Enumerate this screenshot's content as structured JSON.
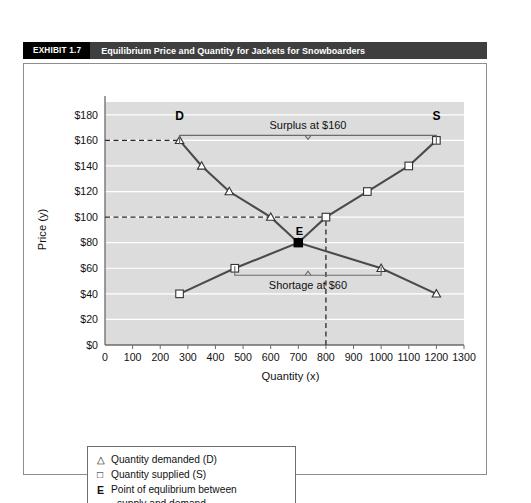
{
  "exhibit": {
    "tag": "EXHIBIT 1.7",
    "title": "Equilibrium Price and Quantity for Jackets for Snowboarders"
  },
  "legend": {
    "demand_mark": "△",
    "demand_label": "Quantity demanded (D)",
    "supply_mark": "□",
    "supply_label": "Quantity supplied (S)",
    "equilibrium_mark": "E",
    "equilibrium_label": "Point of equlibrium between",
    "equilibrium_label_cont": "supply and demand"
  },
  "chart_data": {
    "type": "line",
    "title": "Equilibrium Price and Quantity for Jackets for Snowboarders",
    "xlabel": "Quantity (x)",
    "ylabel": "Price (y)",
    "xlim": [
      0,
      1300
    ],
    "ylim": [
      0,
      190
    ],
    "grid": true,
    "legend_position": "below-plot",
    "xticks": [
      0,
      100,
      200,
      300,
      400,
      500,
      600,
      700,
      800,
      900,
      1000,
      1100,
      1200,
      1300
    ],
    "xtick_labels": [
      "0",
      "100",
      "200",
      "300",
      "400",
      "500",
      "600",
      "700",
      "800",
      "900",
      "1000",
      "1100",
      "1200",
      "1300"
    ],
    "yticks": [
      0,
      20,
      40,
      60,
      80,
      100,
      120,
      140,
      160,
      180
    ],
    "ytick_labels": [
      "$0",
      "$20",
      "$40",
      "$60",
      "$80",
      "$100",
      "$120",
      "$140",
      "$160",
      "$180"
    ],
    "series": [
      {
        "name": "Quantity demanded (D)",
        "marker": "triangle",
        "color": "#4a4a4a",
        "points": [
          {
            "x": 270,
            "y": 160
          },
          {
            "x": 350,
            "y": 140
          },
          {
            "x": 450,
            "y": 120
          },
          {
            "x": 600,
            "y": 100
          },
          {
            "x": 700,
            "y": 80
          },
          {
            "x": 1000,
            "y": 60
          },
          {
            "x": 1200,
            "y": 40
          }
        ]
      },
      {
        "name": "Quantity supplied (S)",
        "marker": "square",
        "color": "#4a4a4a",
        "points": [
          {
            "x": 270,
            "y": 40
          },
          {
            "x": 470,
            "y": 60
          },
          {
            "x": 700,
            "y": 80
          },
          {
            "x": 800,
            "y": 100
          },
          {
            "x": 950,
            "y": 120
          },
          {
            "x": 1100,
            "y": 140
          },
          {
            "x": 1200,
            "y": 160
          }
        ]
      }
    ],
    "equilibrium": {
      "x": 700,
      "y": 80,
      "label": "E"
    },
    "curve_labels": [
      {
        "text": "D",
        "x": 270,
        "y": 176
      },
      {
        "text": "S",
        "x": 1200,
        "y": 176
      }
    ],
    "annotations": [
      {
        "text": "Surplus at $160",
        "price": 160,
        "from_x": 270,
        "to_x": 1200,
        "kind": "brace-above"
      },
      {
        "text": "Shortage at $60",
        "price": 60,
        "from_x": 470,
        "to_x": 1000,
        "kind": "brace-below"
      }
    ],
    "guide_lines": [
      {
        "type": "horizontal-dashed",
        "y": 160,
        "from_x": 0,
        "to_x": 270
      },
      {
        "type": "horizontal-dashed",
        "y": 100,
        "from_x": 0,
        "to_x": 800
      },
      {
        "type": "vertical-dashed",
        "x": 800,
        "from_y": 0,
        "to_y": 100
      }
    ]
  }
}
